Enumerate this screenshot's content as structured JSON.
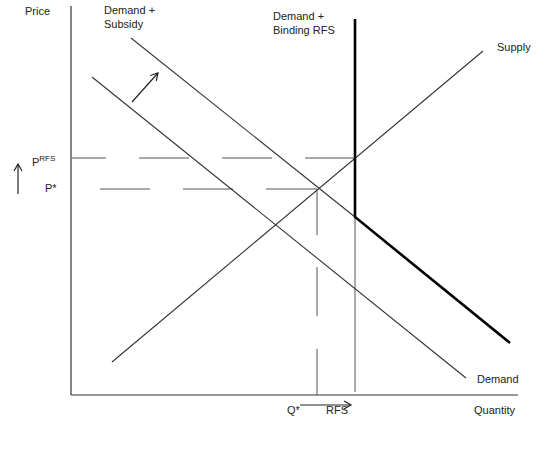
{
  "diagram": {
    "title": "",
    "axes": {
      "y_label": "Price",
      "x_label": "Quantity"
    },
    "curves": {
      "demand": "Demand",
      "demand_subsidy": "Demand +\nSubsidy",
      "demand_subsidy_line1": "Demand +",
      "demand_subsidy_line2": "Subsidy",
      "demand_rfs_line1": "Demand +",
      "demand_rfs_line2": "Binding RFS",
      "supply": "Supply"
    },
    "price_labels": {
      "p_rfs_base": "P",
      "p_rfs_sup": "RFS",
      "p_star": "P*"
    },
    "quantity_labels": {
      "q_star": "Q*",
      "rfs": "RFS"
    },
    "annotations": [
      "Arrow showing demand shift outward (subsidy)",
      "Up arrow next to price axis (price increase)",
      "Right arrow below quantity axis (quantity increase)"
    ],
    "caption": "",
    "colors": {
      "line": "#333333",
      "thick_line": "#000000",
      "dashed": "#555555"
    }
  }
}
